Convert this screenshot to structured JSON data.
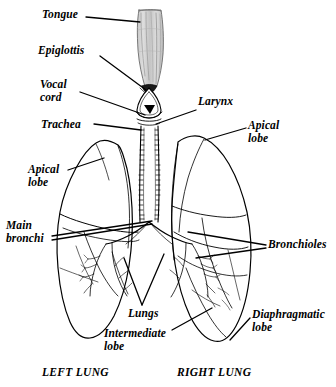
{
  "figure": {
    "background_color": "#ffffff",
    "ink_color": "#000000",
    "tongue_fill_color": "#d2d2d2",
    "tongue_shade_color": "#a8a8a8"
  },
  "labels": {
    "tongue": "Tongue",
    "epiglottis": "Epiglottis",
    "vocal_cord": "Vocal\ncord",
    "trachea": "Trachea",
    "larynx": "Larynx",
    "apical_lobe_right": "Apical\nlobe",
    "apical_lobe_left": "Apical\nlobe",
    "main_bronchi": "Main\nbronchi",
    "bronchioles": "Bronchioles",
    "lungs": "Lungs",
    "intermediate_lobe": "Intermediate\nlobe",
    "diaphragmatic_lobe": "Diaphragmatic\nlobe"
  },
  "captions": {
    "left_lung": "LEFT LUNG",
    "right_lung": "RIGHT LUNG"
  },
  "structures": {
    "tongue": "tongue-shape",
    "epiglottis": "epiglottis-shape",
    "larynx": "larynx-shape",
    "glottis": "glottis-opening",
    "trachea": "trachea-tube",
    "left_lung": "left-lung-outline",
    "right_lung": "right-lung-outline",
    "bronchial_tree": "bronchial-tree"
  }
}
